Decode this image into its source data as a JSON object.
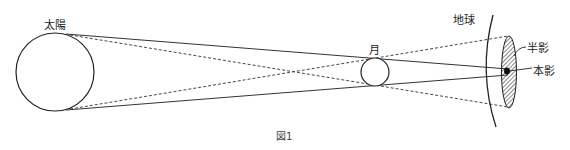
{
  "figure": {
    "caption": "図1",
    "labels": {
      "sun": "太陽",
      "moon": "月",
      "earth": "地球",
      "penumbra": "半影",
      "umbra": "本影"
    },
    "colors": {
      "stroke": "#222222",
      "background": "#ffffff"
    }
  }
}
